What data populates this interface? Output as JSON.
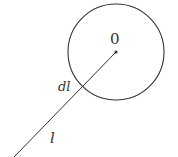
{
  "diagram": {
    "circle": {
      "cx": 116,
      "cy": 52,
      "r": 48,
      "stroke": "#333333"
    },
    "center_point": {
      "x": 116,
      "y": 52
    },
    "line": {
      "x1": 116,
      "y1": 52,
      "x2": 14,
      "y2": 157,
      "stroke": "#333333"
    },
    "labels": {
      "center": "0",
      "element": "dl",
      "length": "l"
    }
  }
}
